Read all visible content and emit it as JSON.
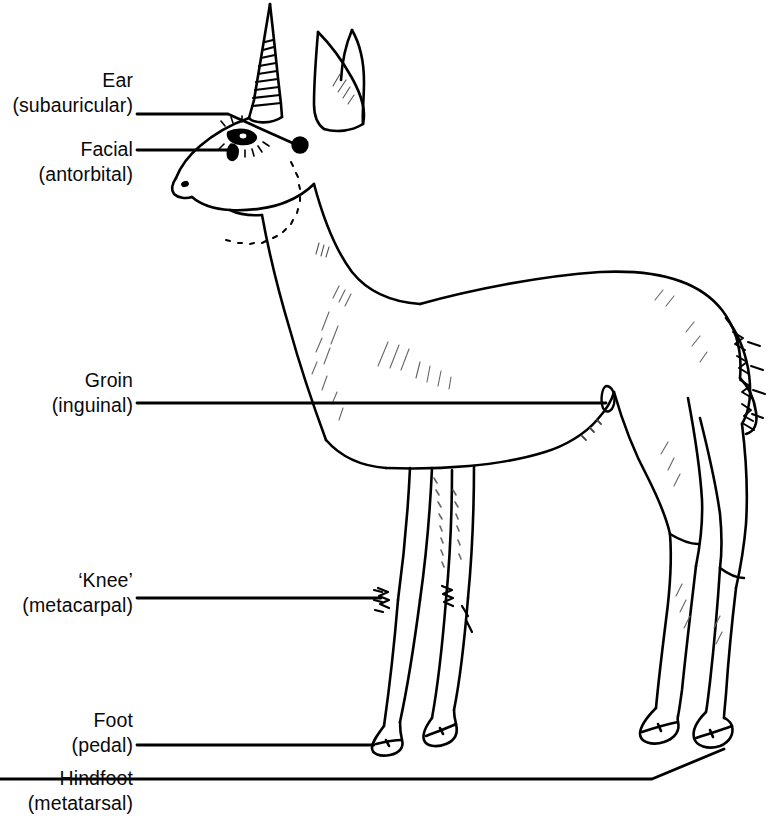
{
  "figure": {
    "kind": "anatomical-line-drawing",
    "ink_color": "#000000",
    "background_color": "#ffffff"
  },
  "labels": [
    {
      "id": "ear",
      "line1": "Ear",
      "line2": "(subauricular)",
      "text_right_px": 133,
      "top_px": 68,
      "leader": {
        "kind": "horizontal-then-diagonal",
        "start_x": 137,
        "start_y": 114,
        "bend_x": 228,
        "bend_y": 114,
        "end_x": 299,
        "end_y": 144
      },
      "marker": {
        "kind": "filled-dot",
        "cx": 300,
        "cy": 145,
        "r": 7.5
      }
    },
    {
      "id": "facial",
      "line1": "Facial",
      "line2": "(antorbital)",
      "text_right_px": 133,
      "top_px": 137,
      "leader": {
        "kind": "horizontal",
        "start_x": 137,
        "start_y": 150,
        "end_x": 236,
        "end_y": 150
      },
      "marker": {
        "kind": "teardrop-slit",
        "cx": 233,
        "cy": 150
      }
    },
    {
      "id": "groin",
      "line1": "Groin",
      "line2": "(inguinal)",
      "text_right_px": 133,
      "top_px": 368,
      "leader": {
        "kind": "horizontal",
        "start_x": 137,
        "start_y": 403,
        "end_x": 605,
        "end_y": 403
      },
      "marker": {
        "kind": "teardrop-slit",
        "cx": 609,
        "cy": 401
      }
    },
    {
      "id": "knee",
      "line1": "‘Knee’",
      "line2": "(metacarpal)",
      "text_right_px": 133,
      "top_px": 568,
      "leader": {
        "kind": "horizontal",
        "start_x": 137,
        "start_y": 598,
        "end_x": 380,
        "end_y": 598
      },
      "marker": {
        "kind": "tuft",
        "cx": 382,
        "cy": 598
      }
    },
    {
      "id": "foot",
      "line1": "Foot",
      "line2": "(pedal)",
      "text_right_px": 133,
      "top_px": 708,
      "leader": {
        "kind": "horizontal",
        "start_x": 137,
        "start_y": 745,
        "end_x": 372,
        "end_y": 745
      },
      "marker": {
        "kind": "hoof",
        "cx": 378,
        "cy": 745
      }
    },
    {
      "id": "hindfoot",
      "line1": "Hindfoot",
      "line2": "(metatarsal)",
      "text_right_px": 133,
      "top_px": 775,
      "leader": {
        "kind": "horizontal-then-diagonal",
        "start_x": 137,
        "start_y": 779,
        "bend_x": 652,
        "bend_y": 779,
        "end_x": 722,
        "end_y": 749
      },
      "marker": {
        "kind": "hoof",
        "cx": 726,
        "cy": 748
      }
    }
  ]
}
